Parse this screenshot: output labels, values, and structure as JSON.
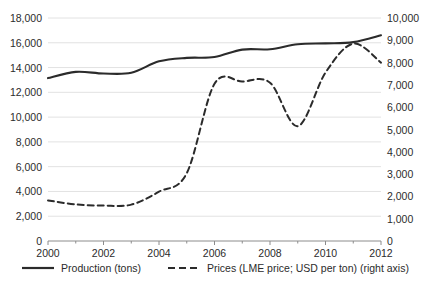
{
  "chart_data": {
    "type": "line",
    "title": "",
    "xlabel": "",
    "ylabel": "",
    "grid": true,
    "legend_position": "bottom",
    "x": [
      2000,
      2001,
      2002,
      2003,
      2004,
      2005,
      2006,
      2007,
      2008,
      2009,
      2010,
      2011,
      2012
    ],
    "xlim": [
      2000,
      2012
    ],
    "x_tick_labels": [
      "2000",
      "2002",
      "2004",
      "2006",
      "2008",
      "2010",
      "2012"
    ],
    "x_tick_values": [
      2000,
      2002,
      2004,
      2006,
      2008,
      2010,
      2012
    ],
    "left_axis": {
      "ylim": [
        0,
        18000
      ],
      "tick_labels": [
        "0",
        "2,000",
        "4,000",
        "6,000",
        "8,000",
        "10,000",
        "12,000",
        "14,000",
        "16,000",
        "18,000"
      ],
      "tick_values": [
        0,
        2000,
        4000,
        6000,
        8000,
        10000,
        12000,
        14000,
        16000,
        18000
      ]
    },
    "right_axis": {
      "ylim": [
        0,
        10000
      ],
      "tick_labels": [
        "0",
        "1,000",
        "2,000",
        "3,000",
        "4,000",
        "5,000",
        "6,000",
        "7,000",
        "8,000",
        "9,000",
        "10,000"
      ],
      "tick_values": [
        0,
        1000,
        2000,
        3000,
        4000,
        5000,
        6000,
        7000,
        8000,
        9000,
        10000
      ]
    },
    "series": [
      {
        "name": "Production (tons)",
        "axis": "left",
        "style": "solid",
        "color": "#2b2b2b",
        "values": [
          13150,
          13650,
          13520,
          13580,
          14500,
          14780,
          14850,
          15450,
          15480,
          15880,
          15950,
          16050,
          16600
        ]
      },
      {
        "name": "Prices (LME price; USD per ton) (right axis)",
        "axis": "right",
        "style": "dashed",
        "color": "#2b2b2b",
        "values": [
          1820,
          1640,
          1590,
          1630,
          2210,
          3040,
          7050,
          7150,
          7100,
          5150,
          7550,
          8850,
          8000
        ]
      }
    ],
    "legend": [
      {
        "label": "Production (tons)",
        "style": "solid",
        "color": "#2b2b2b"
      },
      {
        "label": "Prices (LME price; USD per ton) (right axis)",
        "style": "dashed",
        "color": "#2b2b2b"
      }
    ],
    "colors": {
      "line": "#2b2b2b",
      "grid": "#e2e2e2",
      "axis": "#8c8c8c",
      "text": "#2b2b2b",
      "background": "#ffffff"
    }
  }
}
